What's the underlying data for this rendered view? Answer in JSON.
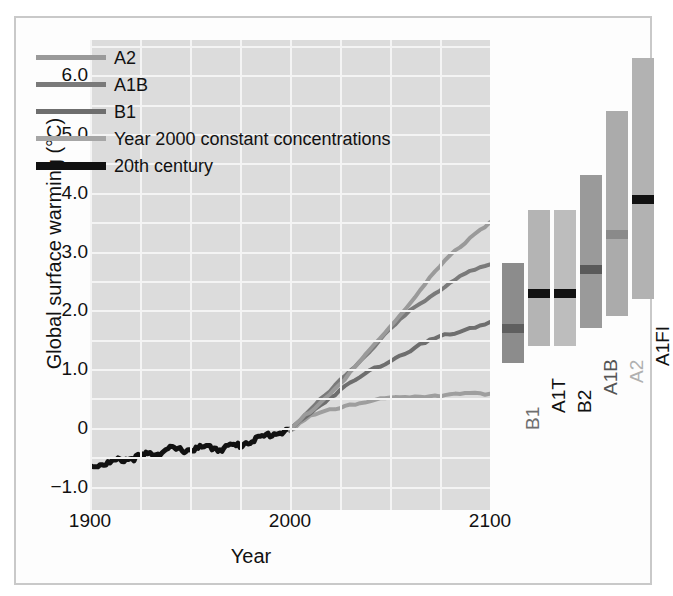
{
  "chart_data": {
    "type": "line",
    "title": "",
    "xlabel": "Year",
    "ylabel": "Global surface warming (°C)",
    "xlim": [
      1900,
      2100
    ],
    "ylim": [
      -1.4,
      6.6
    ],
    "xticks": [
      "1900",
      "2000",
      "2100"
    ],
    "xtick_values": [
      1900,
      2000,
      2100
    ],
    "yticks": [
      "6.0",
      "5.0",
      "4.0",
      "3.0",
      "2.0",
      "1.0",
      "0",
      "-1.0"
    ],
    "ytick_values": [
      6.0,
      5.0,
      4.0,
      3.0,
      2.0,
      1.0,
      0,
      -1.0
    ],
    "grid": true,
    "legend_position": "top-left",
    "legend": [
      {
        "name": "A2",
        "color": "#9a9a9a",
        "width": "thin"
      },
      {
        "name": "A1B",
        "color": "#7a7a7a",
        "width": "thin"
      },
      {
        "name": "B1",
        "color": "#6e6e6e",
        "width": "thin"
      },
      {
        "name": "Year 2000 constant concentrations",
        "color": "#a6a6a6",
        "width": "thin"
      },
      {
        "name": "20th century",
        "color": "#111111",
        "width": "thick"
      }
    ],
    "series": [
      {
        "name": "20th century",
        "color": "#111111",
        "x": [
          1900,
          1905,
          1910,
          1915,
          1920,
          1925,
          1930,
          1935,
          1940,
          1945,
          1950,
          1955,
          1960,
          1965,
          1970,
          1975,
          1980,
          1985,
          1990,
          1995,
          2000
        ],
        "values": [
          -0.65,
          -0.62,
          -0.6,
          -0.55,
          -0.52,
          -0.5,
          -0.44,
          -0.42,
          -0.36,
          -0.38,
          -0.37,
          -0.35,
          -0.33,
          -0.36,
          -0.31,
          -0.3,
          -0.22,
          -0.18,
          -0.11,
          -0.08,
          -0.03
        ]
      },
      {
        "name": "Year 2000 constant concentrations",
        "color": "#9e9e9e",
        "x": [
          2000,
          2010,
          2020,
          2030,
          2040,
          2050,
          2060,
          2070,
          2080,
          2090,
          2100
        ],
        "values": [
          -0.03,
          0.18,
          0.3,
          0.4,
          0.45,
          0.5,
          0.53,
          0.55,
          0.57,
          0.57,
          0.58
        ]
      },
      {
        "name": "B1",
        "color": "#6e6e6e",
        "x": [
          2000,
          2010,
          2020,
          2030,
          2040,
          2050,
          2060,
          2070,
          2080,
          2090,
          2100
        ],
        "values": [
          -0.03,
          0.25,
          0.52,
          0.75,
          0.97,
          1.15,
          1.32,
          1.48,
          1.6,
          1.7,
          1.8
        ]
      },
      {
        "name": "A1B",
        "color": "#7a7a7a",
        "x": [
          2000,
          2010,
          2020,
          2030,
          2040,
          2050,
          2060,
          2070,
          2080,
          2090,
          2100
        ],
        "values": [
          -0.03,
          0.3,
          0.62,
          0.98,
          1.32,
          1.66,
          1.98,
          2.24,
          2.47,
          2.65,
          2.78
        ]
      },
      {
        "name": "A2",
        "color": "#9a9a9a",
        "x": [
          2000,
          2010,
          2020,
          2030,
          2040,
          2050,
          2060,
          2070,
          2080,
          2090,
          2100
        ],
        "values": [
          -0.03,
          0.28,
          0.58,
          0.92,
          1.32,
          1.72,
          2.12,
          2.54,
          2.92,
          3.24,
          3.5
        ]
      }
    ],
    "bars": {
      "description": "Projected global surface warming at 2090-2099 relative to 1980-1999, likely range and best estimate, by SRES scenario",
      "items": [
        {
          "label": "B1",
          "low": 1.1,
          "high": 2.8,
          "best": 1.7,
          "range_color": "#8c8c8c",
          "best_color": "#5f5f5f",
          "label_color": "#6e6e6e"
        },
        {
          "label": "A1T",
          "low": 1.4,
          "high": 3.7,
          "best": 2.3,
          "range_color": "#b4b4b4",
          "best_color": "#111111",
          "label_color": "#111111"
        },
        {
          "label": "B2",
          "low": 1.4,
          "high": 3.7,
          "best": 2.3,
          "range_color": "#bdbdbd",
          "best_color": "#111111",
          "label_color": "#111111"
        },
        {
          "label": "A1B",
          "low": 1.7,
          "high": 4.3,
          "best": 2.7,
          "range_color": "#9a9a9a",
          "best_color": "#5a5a5a",
          "label_color": "#555555"
        },
        {
          "label": "A2",
          "low": 1.9,
          "high": 5.4,
          "best": 3.3,
          "range_color": "#ababab",
          "best_color": "#8a8a8a",
          "label_color": "#b0b0b0"
        },
        {
          "label": "A1FI",
          "low": 2.2,
          "high": 6.3,
          "best": 3.9,
          "range_color": "#b2b2b2",
          "best_color": "#111111",
          "label_color": "#111111"
        }
      ]
    },
    "colors": {
      "plot_background": "#dcdcdc",
      "gridline": "#f4f4f4",
      "frame": "#c9c9c9",
      "figure_background": "#fdfdfd",
      "text": "#111111"
    }
  }
}
